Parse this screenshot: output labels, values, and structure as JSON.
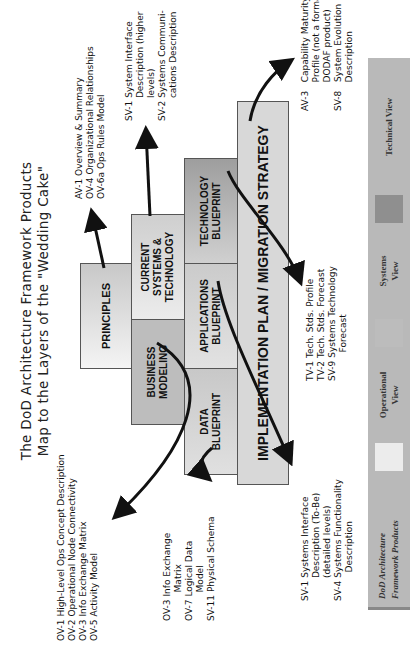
{
  "title": {
    "line1": "The DoD Architecture Framework Products",
    "line2": "Map to the Layers of the \"Wedding Cake\""
  },
  "layers": {
    "principles": "PRINCIPLES",
    "business_modeling": [
      "BUSINESS",
      "MODELING"
    ],
    "current_systems": [
      "CURRENT",
      "SYSTEMS &",
      "TECHNOLOGY"
    ],
    "data_blueprint": [
      "DATA",
      "BLUEPRINT"
    ],
    "applications_blueprint": [
      "APPLICATIONS",
      "BLUEPRINT"
    ],
    "technology_blueprint": [
      "TECHNOLOGY",
      "BLUEPRINT"
    ],
    "implementation": "IMPLEMENTATION PLAN / MIGRATION STRATEGY"
  },
  "notes": {
    "principles": "AV-1 Overview & Summary\nOV-4 Organizational Relationships\nOV-6a Ops Rules Model",
    "business": "OV-1 High-Level Ops Concept Description\nOV-2 Operational Node Connectivity\nOV-3 Info Exchange Matrix\nOV-5 Activity Model",
    "current_systems": "SV-1 System Interface\n        Description (higher\n        levels)\nSV-2 Systems Communi-\n        cations Description",
    "data": "OV-3 Info Exchange\n          Matrix\nOV-7 Logical Data\n          Model\nSV-11 Physical Schema",
    "technology": "TV-1 Tech. Stds. Profile\nTV-2 Tech. Stds. Forecast\nSV-9 Systems Technology\n          Forecast",
    "applications": "SV-1 Systems Interface\n        Description (To-Be)\n        (detailed levels)\nSV-4 Systems Functionality\n          Description",
    "implementation": "AV-3   Capability Maturity\n          Profile (not a formal\n          DODAF product)\nSV-8   System Evolution\n          Description"
  },
  "legend": {
    "title_line1": "DoD Architecture",
    "title_line2": "Framework Products",
    "items": [
      {
        "label_line1": "Operational",
        "label_line2": "View",
        "color": "#ececec"
      },
      {
        "label_line1": "Systems",
        "label_line2": "View",
        "color": "#bcbcbc"
      },
      {
        "label_line1": "Technical View",
        "label_line2": "",
        "color": "#8f8f8f"
      }
    ]
  }
}
